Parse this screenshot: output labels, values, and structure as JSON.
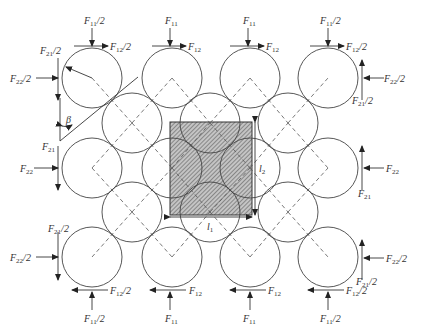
{
  "diagram": {
    "labels": {
      "F11_half": "F",
      "F11_half_sub": "11",
      "F12_half_sub": "12",
      "F21_half_sub": "21",
      "F22_half_sub": "22",
      "half": "/2",
      "F11": "F",
      "F12": "F",
      "F21": "F",
      "F22": "F",
      "sub11": "11",
      "sub12": "12",
      "sub21": "21",
      "sub22": "22",
      "beta": "β",
      "l1": "l",
      "l1_sub": "1",
      "l2": "l",
      "l2_sub": "2"
    },
    "colors": {
      "stroke": "#444444",
      "hatch": "#555555",
      "cell_fill": "#bdbdbd"
    }
  }
}
